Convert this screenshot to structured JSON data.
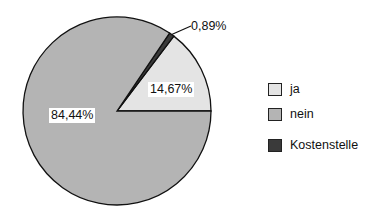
{
  "chart_data": {
    "type": "pie",
    "title": "",
    "categories": [
      "ja",
      "nein",
      "Kostenstelle"
    ],
    "values": [
      14.67,
      84.44,
      0.89
    ],
    "value_labels": [
      "14,67%",
      "84,44%",
      "0,89%"
    ],
    "colors": [
      "#e4e4e4",
      "#b4b4b4",
      "#3a3a3a"
    ],
    "start_angle_deg": 0,
    "direction": "counterclockwise",
    "legend_position": "right"
  },
  "legend": {
    "items": [
      {
        "label": "ja",
        "color": "#e4e4e4"
      },
      {
        "label": "nein",
        "color": "#b4b4b4"
      },
      {
        "label": "Kostenstelle",
        "color": "#3a3a3a"
      }
    ]
  },
  "labels": {
    "ja": "14,67%",
    "nein": "84,44%",
    "kostenstelle": "0,89%"
  }
}
